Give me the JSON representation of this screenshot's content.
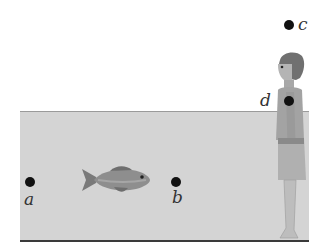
{
  "diagram": {
    "points": [
      {
        "id": "a",
        "label": "a"
      },
      {
        "id": "b",
        "label": "b"
      },
      {
        "id": "c",
        "label": "c"
      },
      {
        "id": "d",
        "label": "d"
      }
    ],
    "objects": [
      "water-tank",
      "fish",
      "person"
    ],
    "colors": {
      "water": "#d4d4d4",
      "dot": "#111111",
      "floor": "#3a3a3a"
    }
  }
}
